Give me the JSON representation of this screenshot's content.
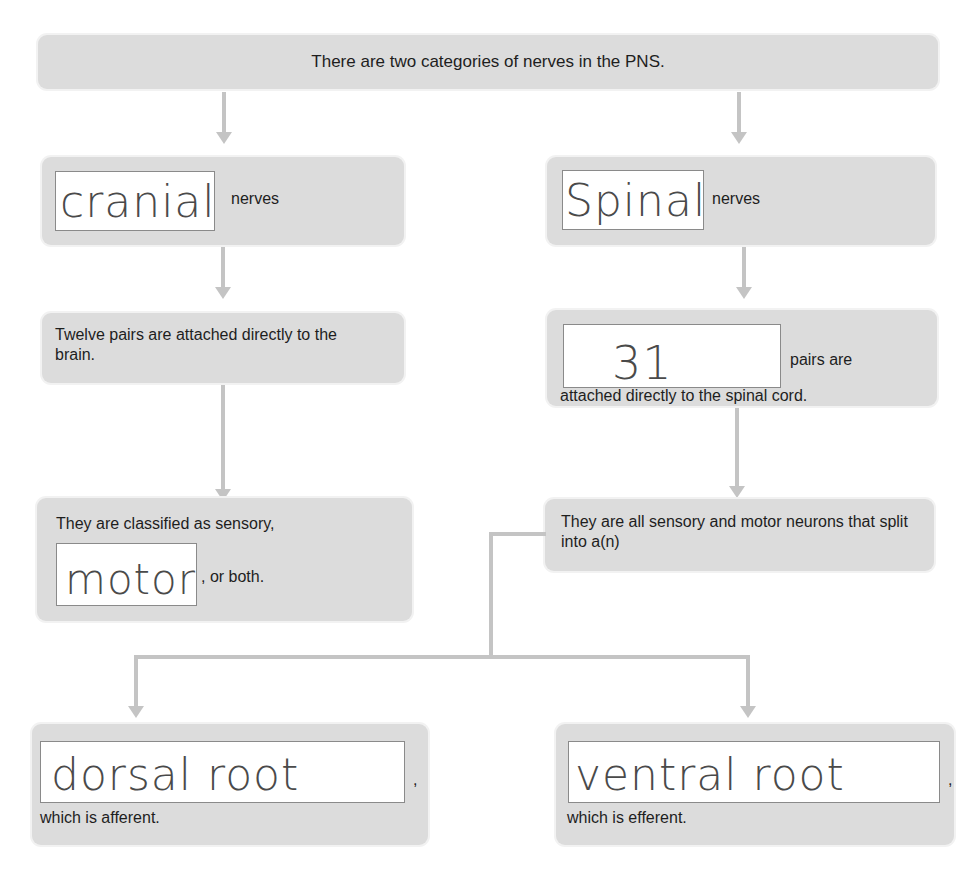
{
  "diagram": {
    "type": "flowchart-worksheet",
    "colors": {
      "box_fill": "#dcdcdc",
      "connector": "#c4c4c4",
      "answer_ink": "#4a4a4a"
    },
    "root": {
      "text": "There are two categories of nerves in the PNS."
    },
    "left_branch": {
      "category_box": {
        "answer": "cranial",
        "suffix": "nerves"
      },
      "count_box": {
        "text": "Twelve pairs are attached directly to the brain."
      },
      "class_box": {
        "prefix": "They are classified as sensory,",
        "answer": "motor",
        "suffix": ", or both."
      }
    },
    "right_branch": {
      "category_box": {
        "answer": "Spinal",
        "suffix": "nerves"
      },
      "count_box": {
        "answer": "31",
        "suffix": "pairs are",
        "line2": "attached directly to the spinal cord."
      },
      "split_box": {
        "text": "They are all sensory and motor neurons that split into a(n)"
      },
      "roots": [
        {
          "answer": "dorsal root",
          "comma": ",",
          "caption": "which is afferent."
        },
        {
          "answer": "ventral root",
          "comma": ",",
          "caption": "which is efferent."
        }
      ]
    }
  }
}
